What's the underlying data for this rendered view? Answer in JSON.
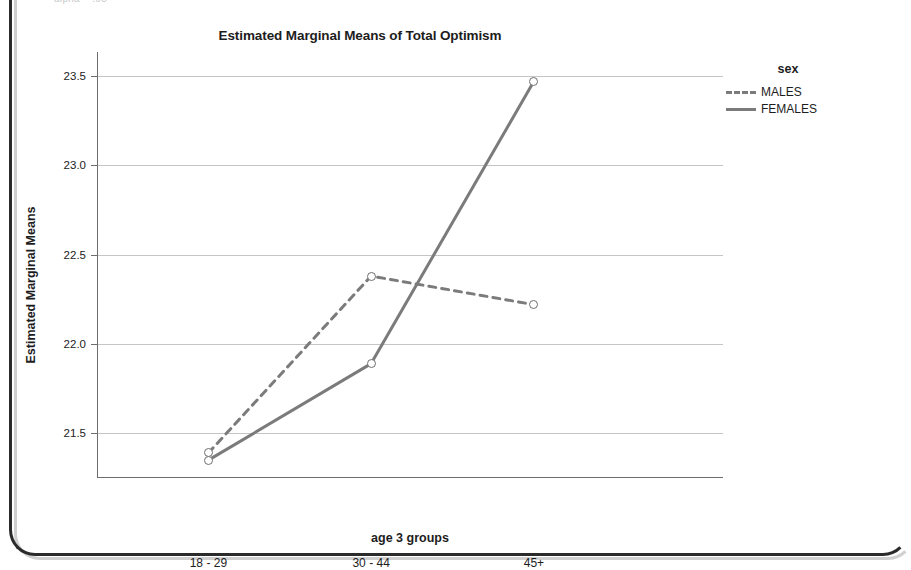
{
  "page": {
    "clipped_top_text": "alpha = .05"
  },
  "chart": {
    "title": "Estimated Marginal Means of Total Optimism",
    "x_axis_title": "age 3 groups",
    "y_axis_title": "Estimated Marginal Means",
    "legend": {
      "title": "sex",
      "entries": [
        {
          "label": "MALES",
          "style": "dashed",
          "color": "#7b7b7b"
        },
        {
          "label": "FEMALES",
          "style": "solid",
          "color": "#7b7b7b"
        }
      ]
    },
    "y_ticks": [
      "21.5",
      "22.0",
      "22.5",
      "23.0",
      "23.5"
    ],
    "x_ticks": [
      "18 - 29",
      "30 - 44",
      "45+"
    ]
  },
  "chart_data": {
    "type": "line",
    "title": "Estimated Marginal Means of Total Optimism",
    "xlabel": "age 3 groups",
    "ylabel": "Estimated Marginal Means",
    "categories": [
      "18 - 29",
      "30 - 44",
      "45+"
    ],
    "series": [
      {
        "name": "MALES",
        "values": [
          21.39,
          22.38,
          22.22
        ],
        "style": "dashed",
        "color": "#7b7b7b",
        "marker": "open-circle"
      },
      {
        "name": "FEMALES",
        "values": [
          21.35,
          21.89,
          23.47
        ],
        "style": "solid",
        "color": "#7b7b7b",
        "marker": "open-circle"
      }
    ],
    "ylim": [
      21.25,
      23.6
    ],
    "yticks": [
      21.5,
      22.0,
      22.5,
      23.0,
      23.5
    ],
    "grid": true,
    "legend_position": "right",
    "legend_title": "sex"
  }
}
